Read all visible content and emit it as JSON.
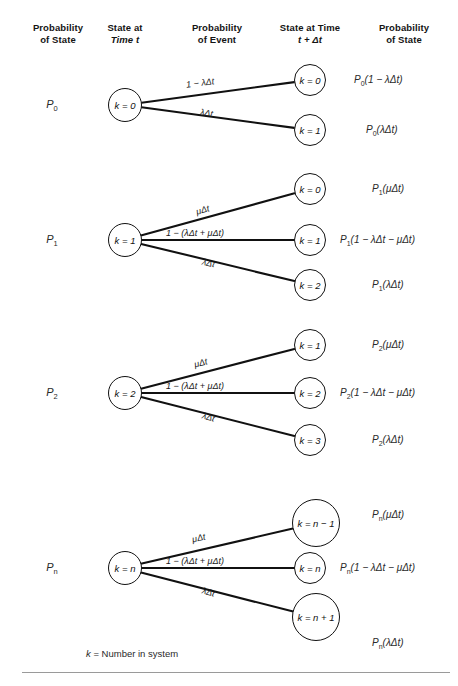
{
  "figure": {
    "footnote": "k = Number in system",
    "footnote_symbol": "k",
    "footnote_text": "= Number in system"
  },
  "headers": [
    {
      "line1": "Probability",
      "line2": "of State"
    },
    {
      "line1": "State at",
      "line2": "Time t"
    },
    {
      "line1": "Probability",
      "line2": "of Event"
    },
    {
      "line1": "State at Time",
      "line2": "t + Δt"
    },
    {
      "line1": "Probability",
      "line2": "of State"
    }
  ],
  "groups": [
    {
      "state_label": "P",
      "state_sub": "0",
      "source_node": "k = 0",
      "branches": [
        {
          "event": "1 − λΔt",
          "target": "k = 0",
          "probability": "P",
          "probability_sub": "0",
          "probability_rest": "(1 − λΔt)"
        },
        {
          "event": "λΔt",
          "target": "k = 1",
          "probability": "P",
          "probability_sub": "0",
          "probability_rest": "(λΔt)"
        }
      ]
    },
    {
      "state_label": "P",
      "state_sub": "1",
      "source_node": "k = 1",
      "branches": [
        {
          "event": "μΔt",
          "target": "k = 0",
          "probability": "P",
          "probability_sub": "1",
          "probability_rest": "(μΔt)"
        },
        {
          "event": "1 − (λΔt + μΔt)",
          "target": "k = 1",
          "probability": "P",
          "probability_sub": "1",
          "probability_rest": "(1 − λΔt − μΔt)"
        },
        {
          "event": "λΔt",
          "target": "k = 2",
          "probability": "P",
          "probability_sub": "1",
          "probability_rest": "(λΔt)"
        }
      ]
    },
    {
      "state_label": "P",
      "state_sub": "2",
      "source_node": "k = 2",
      "branches": [
        {
          "event": "μΔt",
          "target": "k = 1",
          "probability": "P",
          "probability_sub": "2",
          "probability_rest": "(μΔt)"
        },
        {
          "event": "1 − (λΔt + μΔt)",
          "target": "k = 2",
          "probability": "P",
          "probability_sub": "2",
          "probability_rest": "(1 − λΔt − μΔt)"
        },
        {
          "event": "λΔt",
          "target": "k = 3",
          "probability": "P",
          "probability_sub": "2",
          "probability_rest": "(λΔt)"
        }
      ]
    },
    {
      "state_label": "P",
      "state_sub": "n",
      "source_node": "k = n",
      "branches": [
        {
          "event": "μΔt",
          "target": "k = n − 1",
          "probability": "P",
          "probability_sub": "n",
          "probability_rest": "(μΔt)"
        },
        {
          "event": "1 − (λΔt + μΔt)",
          "target": "k = n",
          "probability": "P",
          "probability_sub": "n",
          "probability_rest": "(1 − λΔt − μΔt)"
        },
        {
          "event": "λΔt",
          "target": "k = n + 1",
          "probability": "P",
          "probability_sub": "n",
          "probability_rest": "(λΔt)"
        }
      ]
    }
  ],
  "colors": {
    "ink": "#111111",
    "rule": "#9a9a9a",
    "background": "#ffffff"
  }
}
